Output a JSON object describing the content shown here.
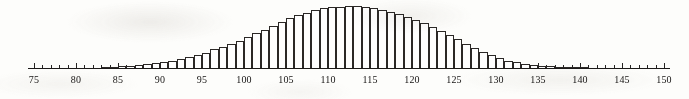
{
  "figure": {
    "kind": "histogram-figure",
    "background_color": "#fdfdfb",
    "ink_color": "#2e2c2a",
    "bar_fill_color": "#ffffff",
    "axis_color": "#1f1d1c"
  },
  "axis": {
    "name": "horizontal-measurement-axis",
    "min": 75,
    "max": 150,
    "major_tick_step": 5,
    "minor_tick_step": 1,
    "tick_labels": [
      "75",
      "80",
      "85",
      "90",
      "95",
      "100",
      "105",
      "110",
      "115",
      "120",
      "125",
      "130",
      "135",
      "140",
      "145",
      "150"
    ],
    "tick_label_values": [
      75,
      80,
      85,
      90,
      95,
      100,
      105,
      110,
      115,
      120,
      125,
      130,
      135,
      140,
      145,
      150
    ]
  },
  "chart_data": {
    "type": "bar",
    "title": "",
    "subtitle": "",
    "xlabel": "",
    "ylabel": "",
    "grid": false,
    "legend": false,
    "xlim": [
      75,
      150
    ],
    "ylim": [
      0,
      100
    ],
    "bin_width": 1,
    "categories": [
      "75",
      "76",
      "77",
      "78",
      "79",
      "80",
      "81",
      "82",
      "83",
      "84",
      "85",
      "86",
      "87",
      "88",
      "89",
      "90",
      "91",
      "92",
      "93",
      "94",
      "95",
      "96",
      "97",
      "98",
      "99",
      "100",
      "101",
      "102",
      "103",
      "104",
      "105",
      "106",
      "107",
      "108",
      "109",
      "110",
      "111",
      "112",
      "113",
      "114",
      "115",
      "116",
      "117",
      "118",
      "119",
      "120",
      "121",
      "122",
      "123",
      "124",
      "125",
      "126",
      "127",
      "128",
      "129",
      "130",
      "131",
      "132",
      "133",
      "134",
      "135",
      "136",
      "137",
      "138",
      "139",
      "140",
      "141",
      "142",
      "143",
      "144",
      "145",
      "146",
      "147",
      "148",
      "149"
    ],
    "values": [
      0,
      0,
      0,
      0,
      0,
      0,
      0,
      0,
      1,
      2,
      3,
      4,
      5,
      6,
      8,
      10,
      12,
      15,
      18,
      21,
      25,
      30,
      34,
      39,
      44,
      50,
      56,
      62,
      68,
      74,
      80,
      85,
      89,
      93,
      96,
      98,
      99,
      100,
      100,
      99,
      97,
      94,
      91,
      87,
      83,
      78,
      72,
      66,
      60,
      53,
      46,
      39,
      32,
      26,
      21,
      16,
      12,
      9,
      7,
      5,
      4,
      3,
      2,
      2,
      1,
      1,
      0,
      0,
      0,
      0,
      0,
      0,
      0,
      0,
      0
    ],
    "peak_category": "112",
    "peak_value": 100,
    "shape": "bell-shaped with slight right skew"
  }
}
